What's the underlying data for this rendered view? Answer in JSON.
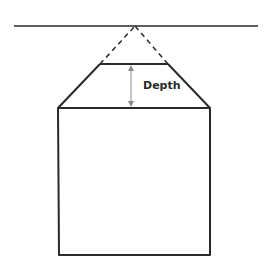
{
  "diagram": {
    "labels": {
      "depth": "Depth"
    },
    "elements": [
      "horizon-line",
      "vanishing-point",
      "converging-dashed-lines",
      "trapezoid-top-face",
      "depth-arrow",
      "front-rectangle"
    ],
    "colors": {
      "stroke": "#2a2a2a",
      "arrow": "#8a8a8a",
      "background": "#ffffff"
    }
  }
}
